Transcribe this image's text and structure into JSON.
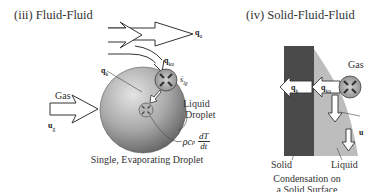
{
  "panel_iii": {
    "title": "(iii) Fluid-Fluid",
    "caption": "Single, Evaporating Droplet",
    "labels": {
      "gas": "Gas",
      "u_g": "u",
      "u_g_sub": "g",
      "q_u": "q",
      "q_u_sub": "u",
      "q_ku": "q",
      "q_ku_sub": "ku",
      "q_k": "q",
      "q_k_sub": "k",
      "s_lg": "ṡ",
      "s_lg_sub": "lg",
      "liquid_droplet_1": "Liquid",
      "liquid_droplet_2": "Droplet",
      "storage_term": "−ρc",
      "storage_term_sub": "p",
      "dT": "dT",
      "dt": "dt"
    }
  },
  "panel_iv": {
    "title": "(iv) Solid-Fluid-Fluid",
    "caption_line1": "Condensation on",
    "caption_line2": "a Solid Surface",
    "labels": {
      "gas": "Gas",
      "solid": "Solid",
      "liquid": "Liquid",
      "q_k": "q",
      "q_k_sub": "k",
      "q_ku": "q",
      "q_ku_sub": "ku",
      "u": "u"
    }
  },
  "colors": {
    "solid": "#4a4a4a",
    "liquid_film": "#bdbdbd",
    "droplet_light": "#d8d8d8",
    "droplet_dark": "#6e6e6e",
    "arrow_outline": "#333333",
    "background": "#ffffff"
  }
}
